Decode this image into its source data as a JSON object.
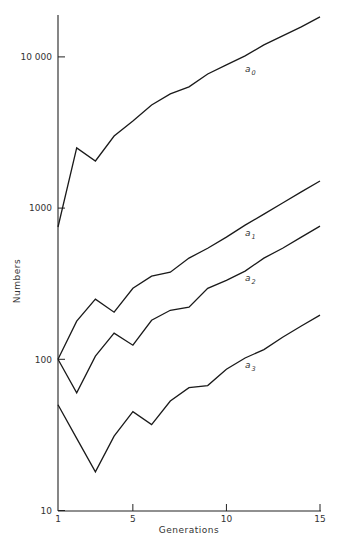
{
  "chart_data": {
    "type": "line",
    "title": "",
    "xlabel": "Generations",
    "ylabel": "Numbers",
    "yscale": "log",
    "xlim": [
      1,
      15
    ],
    "ylim": [
      10,
      20000
    ],
    "grid": false,
    "legend": "inline labels near lines",
    "x": [
      1,
      2,
      3,
      4,
      5,
      6,
      7,
      8,
      9,
      10,
      11,
      12,
      13,
      14,
      15
    ],
    "x_ticks": [
      1,
      5,
      10,
      15
    ],
    "x_tick_labels": [
      "1",
      "5",
      "10",
      "15"
    ],
    "y_ticks": [
      10,
      100,
      1000,
      10000
    ],
    "y_tick_labels": [
      "10",
      "100",
      "1000",
      "10 000"
    ],
    "series": [
      {
        "name": "a0",
        "label_main": "a",
        "label_sub": "0",
        "values": [
          750,
          2500,
          2050,
          3000,
          3770,
          4810,
          5690,
          6330,
          7710,
          8850,
          10150,
          12000,
          13800,
          15800,
          18400
        ]
      },
      {
        "name": "a1",
        "label_main": "a",
        "label_sub": "1",
        "values": [
          100,
          179,
          250,
          205,
          295,
          355,
          377,
          467,
          543,
          643,
          772,
          912,
          1080,
          1280,
          1510
        ]
      },
      {
        "name": "a2",
        "label_main": "a",
        "label_sub": "2",
        "values": [
          100,
          60,
          105,
          149,
          124,
          181,
          211,
          221,
          295,
          333,
          383,
          467,
          543,
          643,
          760
        ]
      },
      {
        "name": "a3",
        "label_main": "a",
        "label_sub": "3",
        "values": [
          50,
          30,
          18,
          31,
          45,
          37,
          53,
          65,
          67,
          86,
          102,
          116,
          140,
          166,
          196
        ]
      }
    ],
    "annotations": [
      {
        "text": "a0",
        "near": "a0 line at x≈11"
      },
      {
        "text": "a1",
        "near": "a1 line at x≈11"
      },
      {
        "text": "a2",
        "near": "a2 line at x≈11"
      },
      {
        "text": "a3",
        "near": "a3 line at x≈11"
      }
    ]
  }
}
